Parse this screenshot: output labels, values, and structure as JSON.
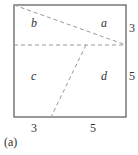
{
  "diagram": {
    "regions": {
      "a": "a",
      "b": "b",
      "c": "c",
      "d": "d"
    },
    "side_labels": {
      "right_top": "3",
      "right_bottom": "5",
      "bottom_left": "3",
      "bottom_right": "5"
    },
    "caption": "(a)",
    "colors": {
      "edge": "#555555",
      "dash": "#999999",
      "text": "#333333"
    }
  }
}
